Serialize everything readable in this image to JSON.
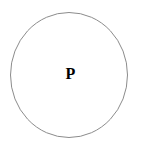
{
  "figure": {
    "type": "set-diagram",
    "title": "",
    "background_color": "#ffffff",
    "width": 142,
    "height": 148
  },
  "shapes": [
    {
      "name": "set-circle-p",
      "kind": "ellipse",
      "center_x": 69,
      "center_y": 75,
      "radius_x": 59,
      "radius_y": 63,
      "stroke_color": "#8c8c8c",
      "stroke_width": 1,
      "fill_color": "none"
    }
  ],
  "labels": {
    "set_p": "P"
  },
  "colors": {
    "outline": "#8c8c8c",
    "text": "#000000",
    "background": "#ffffff"
  }
}
